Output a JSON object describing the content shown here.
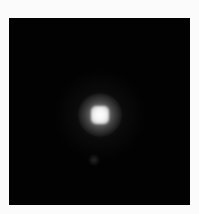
{
  "image": {
    "description": "Point source (PSF-like bright spot) on black background inside a light border",
    "background_color": "#fbfbfb",
    "frame_color": "#020202",
    "source": {
      "center_x_in_frame": 91,
      "center_y_in_frame": 97,
      "core_color": "#ffffff"
    },
    "faint_feature": {
      "center_x_in_frame": 85,
      "center_y_in_frame": 142
    }
  }
}
